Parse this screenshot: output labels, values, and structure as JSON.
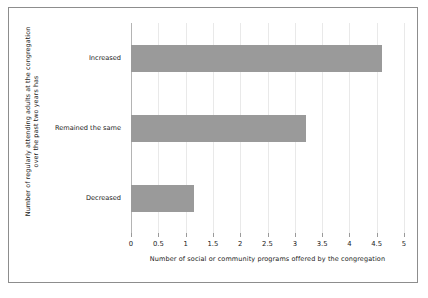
{
  "chart_data": {
    "type": "bar",
    "orientation": "horizontal",
    "title": "",
    "categories": [
      "Increased",
      "Remained the same",
      "Decreased"
    ],
    "values": [
      4.6,
      3.2,
      1.15
    ],
    "xlabel": "Number of social or community programs offered by the congregation",
    "ylabel_lines": [
      "Number of regularly attending adults at the congregation",
      "over the past two years has"
    ],
    "ylabel": "Number of regularly attending adults at the congregation over the past two years has",
    "xlim": [
      0,
      5
    ],
    "xticks": [
      0,
      0.5,
      1,
      1.5,
      2,
      2.5,
      3,
      3.5,
      4,
      4.5,
      5
    ],
    "xtick_labels": [
      "0",
      "0.5",
      "1",
      "1.5",
      "2",
      "2.5",
      "3",
      "3.5",
      "4",
      "4.5",
      "5"
    ],
    "grid": true,
    "grid_axis": "x",
    "legend": null,
    "bar_color": "#9a9a9a",
    "gridline_color": "#e9e9e9",
    "axis_color": "#b4b4b4",
    "frame_color": "#8d8d8d",
    "background_color": "#ffffff"
  }
}
